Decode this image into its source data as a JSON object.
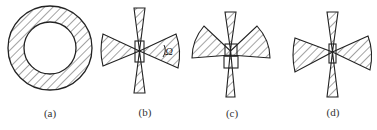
{
  "figure": {
    "panels": [
      {
        "id": "a",
        "label": "(a)",
        "shape": "hatched annulus (ring)"
      },
      {
        "id": "b",
        "label": "(b)",
        "shape": "horizontal bow-tie wedges with vertical needle and central box",
        "angle_symbol": "Ω"
      },
      {
        "id": "c",
        "label": "(c)",
        "shape": "upward-angled wedges with vertical needle and central box"
      },
      {
        "id": "d",
        "label": "(d)",
        "shape": "horizontal bow-tie wedges with vertical needle and small central box"
      }
    ],
    "colors": {
      "stroke": "#222222",
      "hatch": "#333333",
      "background": "#ffffff"
    }
  }
}
